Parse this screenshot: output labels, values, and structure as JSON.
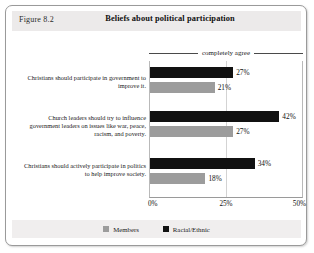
{
  "figure": {
    "number_label": "Figure 8.2",
    "title": "Beliefs about political participation",
    "annotation": "completely agree"
  },
  "legend": {
    "items": [
      {
        "label": "Members",
        "color": "#9c9c9c",
        "swatch_name": "legend-swatch-members"
      },
      {
        "label": "Racial/Ethnic",
        "color": "#111111",
        "swatch_name": "legend-swatch-racial-ethnic"
      }
    ]
  },
  "axis": {
    "ticks": [
      "0%",
      "25%",
      "50%"
    ]
  },
  "chart_data": {
    "type": "bar",
    "orientation": "horizontal",
    "title": "Beliefs about political participation",
    "xlabel": "",
    "ylabel": "",
    "xlim": [
      0,
      50
    ],
    "xticks": [
      0,
      25,
      50
    ],
    "xtick_labels": [
      "0%",
      "25%",
      "50%"
    ],
    "grid": true,
    "legend_position": "bottom",
    "annotation": "completely agree",
    "categories": [
      "Christians should participate in government to improve it.",
      "Church leaders should try to influence government leaders on issues like war, peace, racism, and poverty.",
      "Christians should actively participate in politics to help improve society."
    ],
    "series": [
      {
        "name": "Racial/Ethnic",
        "color": "#111111",
        "values": [
          27,
          42,
          34
        ],
        "value_labels": [
          "27%",
          "42%",
          "34%"
        ]
      },
      {
        "name": "Members",
        "color": "#9c9c9c",
        "values": [
          21,
          27,
          18
        ],
        "value_labels": [
          "21%",
          "27%",
          "18%"
        ]
      }
    ]
  }
}
